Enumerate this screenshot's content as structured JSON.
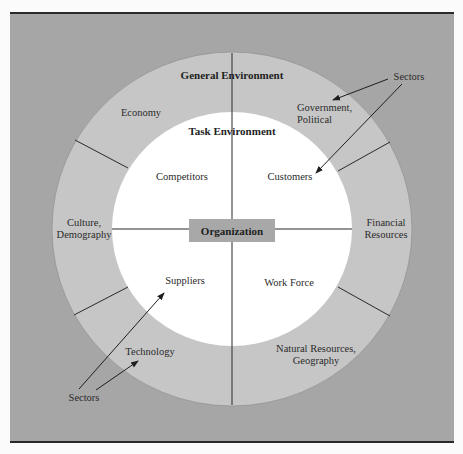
{
  "diagram": {
    "center": {
      "label": "Organization"
    },
    "inner_ring": {
      "title": "Task Environment",
      "sectors": [
        "Competitors",
        "Customers",
        "Suppliers",
        "Work Force"
      ]
    },
    "outer_ring": {
      "title": "General Environment",
      "sectors": [
        "Economy",
        "Government, Political",
        "Culture, Demography",
        "Financial Resources",
        "Technology",
        "Natural Resources, Geography"
      ]
    },
    "callouts": [
      {
        "label": "Sectors",
        "position": "top-right",
        "points_to": [
          "Government, Political",
          "Customers"
        ]
      },
      {
        "label": "Sectors",
        "position": "bottom-left",
        "points_to": [
          "Suppliers",
          "Technology"
        ]
      }
    ]
  },
  "labels": {
    "general_env": "General Environment",
    "task_env": "Task Environment",
    "organization": "Organization",
    "competitors": "Competitors",
    "customers": "Customers",
    "suppliers": "Suppliers",
    "work_force": "Work Force",
    "economy": "Economy",
    "government_1": "Government,",
    "government_2": "Political",
    "culture_1": "Culture,",
    "culture_2": "Demography",
    "financial_1": "Financial",
    "financial_2": "Resources",
    "technology": "Technology",
    "natural_1": "Natural Resources,",
    "natural_2": "Geography",
    "sectors_top": "Sectors",
    "sectors_bottom": "Sectors"
  },
  "colors": {
    "background": "#a6a6a6",
    "outer_ring": "#c6c6c6",
    "inner_circle": "#ffffff",
    "organization_box": "#a8a8a8",
    "lines": "#2a2a2a"
  }
}
